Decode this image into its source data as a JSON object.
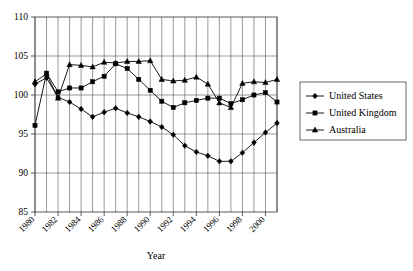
{
  "chart_data": {
    "type": "line",
    "title": "",
    "xlabel": "Year",
    "ylabel": "",
    "xlim": [
      1980,
      2001
    ],
    "ylim": [
      85,
      110
    ],
    "grid": true,
    "legend_position": "right",
    "y_ticks": [
      85,
      90,
      95,
      100,
      105,
      110
    ],
    "x_ticks": [
      1980,
      1982,
      1984,
      1986,
      1988,
      1990,
      1992,
      1994,
      1996,
      1998,
      2000
    ],
    "x": [
      1980,
      1981,
      1982,
      1983,
      1984,
      1985,
      1986,
      1987,
      1988,
      1989,
      1990,
      1991,
      1992,
      1993,
      1994,
      1995,
      1996,
      1997,
      1998,
      1999,
      2000,
      2001
    ],
    "series": [
      {
        "name": "United States",
        "marker": "diamond",
        "values": [
          101.4,
          102.2,
          99.7,
          99.1,
          98.2,
          97.2,
          97.8,
          98.3,
          97.7,
          97.2,
          96.6,
          95.9,
          94.9,
          93.5,
          92.7,
          92.2,
          91.5,
          91.5,
          92.6,
          93.9,
          95.2,
          96.4
        ]
      },
      {
        "name": "United Kingdom",
        "marker": "square",
        "values": [
          96.1,
          102.8,
          100.4,
          100.9,
          100.9,
          101.7,
          102.4,
          104.0,
          103.4,
          102.0,
          100.6,
          99.2,
          98.4,
          99.0,
          99.3,
          99.6,
          99.6,
          98.9,
          99.4,
          100.0,
          100.3,
          99.1
        ]
      },
      {
        "name": "Australia",
        "marker": "triangle",
        "values": [
          101.7,
          102.7,
          99.6,
          103.9,
          103.8,
          103.6,
          104.2,
          104.1,
          104.3,
          104.3,
          104.4,
          102.0,
          101.8,
          101.9,
          102.3,
          101.4,
          99.0,
          98.4,
          101.5,
          101.7,
          101.6,
          102.0
        ]
      }
    ]
  },
  "axis": {
    "x_title": "Year"
  },
  "legend": {
    "entries": [
      {
        "label": "United States"
      },
      {
        "label": "United Kingdom"
      },
      {
        "label": "Australia"
      }
    ]
  }
}
